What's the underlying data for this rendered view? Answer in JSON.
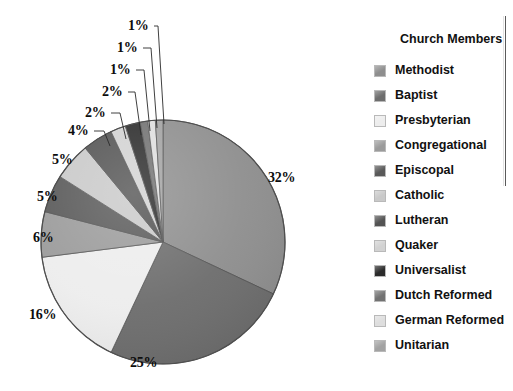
{
  "chart_data": {
    "type": "pie",
    "title": "Church Members",
    "xlabel": "",
    "ylabel": "",
    "legend_position": "right",
    "grid": false,
    "start_angle_deg": 0,
    "direction": "clockwise",
    "unit": "%",
    "categories": [
      "Methodist",
      "Baptist",
      "Presbyterian",
      "Congregational",
      "Episcopal",
      "Catholic",
      "Lutheran",
      "Quaker",
      "Universalist",
      "Dutch Reformed",
      "German Reformed",
      "Unitarian"
    ],
    "values": [
      32,
      25,
      16,
      6,
      5,
      5,
      4,
      2,
      2,
      1,
      1,
      1
    ],
    "labels": [
      "32%",
      "25%",
      "16%",
      "6%",
      "5%",
      "5%",
      "4%",
      "2%",
      "2%",
      "1%",
      "1%",
      "1%"
    ],
    "colors": [
      "#8e8e8e",
      "#6d6d6d",
      "#ededed",
      "#9b9b9b",
      "#595959",
      "#c9c9c9",
      "#535353",
      "#d2d2d2",
      "#2b2b2b",
      "#727272",
      "#dedede",
      "#a2a2a2"
    ],
    "slices": [
      {
        "name": "Methodist",
        "value": 32,
        "label": "32%",
        "color": "#8e8e8e"
      },
      {
        "name": "Baptist",
        "value": 25,
        "label": "25%",
        "color": "#6d6d6d"
      },
      {
        "name": "Presbyterian",
        "value": 16,
        "label": "16%",
        "color": "#ededed"
      },
      {
        "name": "Congregational",
        "value": 6,
        "label": "6%",
        "color": "#9b9b9b"
      },
      {
        "name": "Episcopal",
        "value": 5,
        "label": "5%",
        "color": "#595959"
      },
      {
        "name": "Catholic",
        "value": 5,
        "label": "5%",
        "color": "#c9c9c9"
      },
      {
        "name": "Lutheran",
        "value": 4,
        "label": "4%",
        "color": "#535353"
      },
      {
        "name": "Quaker",
        "value": 2,
        "label": "2%",
        "color": "#d2d2d2"
      },
      {
        "name": "Universalist",
        "value": 2,
        "label": "2%",
        "color": "#2b2b2b"
      },
      {
        "name": "Dutch Reformed",
        "value": 1,
        "label": "1%",
        "color": "#727272"
      },
      {
        "name": "German Reformed",
        "value": 1,
        "label": "1%",
        "color": "#dedede"
      },
      {
        "name": "Unitarian",
        "value": 1,
        "label": "1%",
        "color": "#a2a2a2"
      }
    ]
  },
  "legend": {
    "title": "Church Members",
    "items": [
      {
        "label": "Methodist",
        "color": "#8e8e8e"
      },
      {
        "label": "Baptist",
        "color": "#6d6d6d"
      },
      {
        "label": "Presbyterian",
        "color": "#ededed"
      },
      {
        "label": "Congregational",
        "color": "#9b9b9b"
      },
      {
        "label": "Episcopal",
        "color": "#595959"
      },
      {
        "label": "Catholic",
        "color": "#c9c9c9"
      },
      {
        "label": "Lutheran",
        "color": "#535353"
      },
      {
        "label": "Quaker",
        "color": "#d2d2d2"
      },
      {
        "label": "Universalist",
        "color": "#2b2b2b"
      },
      {
        "label": "Dutch Reformed",
        "color": "#727272"
      },
      {
        "label": "German Reformed",
        "color": "#dedede"
      },
      {
        "label": "Unitarian",
        "color": "#a2a2a2"
      }
    ]
  },
  "pie_geometry": {
    "center_x": 163,
    "center_y": 242,
    "radius": 122,
    "outline_color": "#4f4f4f"
  },
  "label_positions": [
    {
      "label": "32%",
      "x": 268,
      "y": 178,
      "leader": false
    },
    {
      "label": "25%",
      "x": 130,
      "y": 363,
      "leader": false
    },
    {
      "label": "16%",
      "x": 29,
      "y": 315,
      "leader": false
    },
    {
      "label": "6%",
      "x": 33,
      "y": 238,
      "leader": false
    },
    {
      "label": "5%",
      "x": 37,
      "y": 197,
      "leader": false
    },
    {
      "label": "5%",
      "x": 52,
      "y": 160,
      "leader": false
    },
    {
      "label": "4%",
      "x": 68,
      "y": 131,
      "leader": true,
      "lx1": 94,
      "ly1": 131,
      "lx2": 110,
      "ly2": 146
    },
    {
      "label": "2%",
      "x": 85,
      "y": 113,
      "leader": true,
      "lx1": 111,
      "ly1": 113,
      "lx2": 126,
      "ly2": 139
    },
    {
      "label": "2%",
      "x": 102,
      "y": 92,
      "leader": true,
      "lx1": 128,
      "ly1": 92,
      "lx2": 141,
      "ly2": 135
    },
    {
      "label": "1%",
      "x": 110,
      "y": 70,
      "leader": true,
      "lx1": 136,
      "ly1": 70,
      "lx2": 150,
      "ly2": 131
    },
    {
      "label": "1%",
      "x": 117,
      "y": 48,
      "leader": true,
      "lx1": 143,
      "ly1": 48,
      "lx2": 157,
      "ly2": 128
    },
    {
      "label": "1%",
      "x": 128,
      "y": 26,
      "leader": true,
      "lx1": 154,
      "ly1": 26,
      "lx2": 164,
      "ly2": 124
    }
  ]
}
